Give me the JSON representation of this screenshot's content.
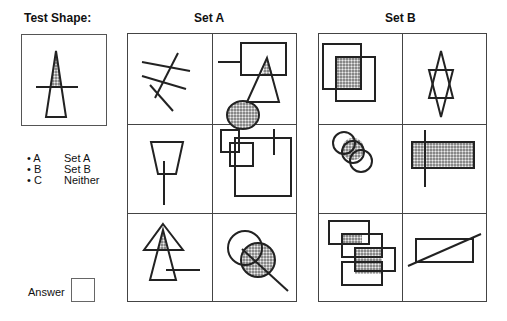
{
  "test_shape": {
    "title": "Test Shape:",
    "description": "Tall triangle with dotted upper portion crossed by a horizontal line"
  },
  "set_a": {
    "title": "Set A",
    "cells": [
      {
        "id": "a1",
        "description": "Four crossing straight lines"
      },
      {
        "id": "a2",
        "description": "Rectangle with stub line, triangle and dotted circle; overlaps dotted"
      },
      {
        "id": "a3",
        "description": "Inverted trapezoid with vertical line through bottom"
      },
      {
        "id": "a4",
        "description": "Three overlapping squares with vertical line"
      },
      {
        "id": "a5",
        "description": "Two overlapping triangles with horizontal line; overlap dotted"
      },
      {
        "id": "a6",
        "description": "Two overlapping circles crossed by diagonal line; one dotted"
      }
    ]
  },
  "set_b": {
    "title": "Set B",
    "cells": [
      {
        "id": "b1",
        "description": "Two overlapping squares; overlap dotted"
      },
      {
        "id": "b2",
        "description": "Star of David (two overlapping triangles)"
      },
      {
        "id": "b3",
        "description": "Three overlapping circles; overlaps dotted"
      },
      {
        "id": "b4",
        "description": "Dotted rectangle with vertical line through it"
      },
      {
        "id": "b5",
        "description": "Four overlapping rectangles; overlaps dotted"
      },
      {
        "id": "b6",
        "description": "Rectangle crossed by diagonal line"
      }
    ]
  },
  "options": [
    {
      "key": "A",
      "label": "Set A"
    },
    {
      "key": "B",
      "label": "Set B"
    },
    {
      "key": "C",
      "label": "Neither"
    }
  ],
  "answer": {
    "label": "Answer",
    "value": ""
  },
  "colors": {
    "line": "#222222",
    "grid": "#444444",
    "dot_fill": "#9a9a9a"
  }
}
